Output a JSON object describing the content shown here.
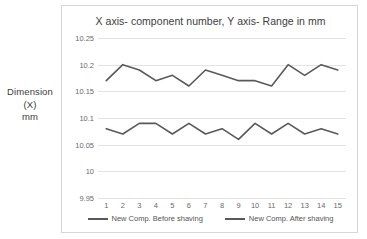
{
  "y_axis_title": "Dimension (X)\nmm",
  "y_axis_title_line1": "Dimension (X)",
  "y_axis_title_line2": "mm",
  "legend": {
    "entries": [
      {
        "label": "New Comp. Before shaving",
        "color": "#595959"
      },
      {
        "label": "New Comp. After shaving",
        "color": "#595959"
      }
    ]
  },
  "chart_data": {
    "type": "line",
    "title": "X axis- component number, Y axis- Range in mm",
    "xlabel": "",
    "ylabel": "Dimension (X) mm",
    "x": [
      1,
      2,
      3,
      4,
      5,
      6,
      7,
      8,
      9,
      10,
      11,
      12,
      13,
      14,
      15
    ],
    "categories": [
      "1",
      "2",
      "3",
      "4",
      "5",
      "6",
      "7",
      "8",
      "9",
      "10",
      "11",
      "12",
      "13",
      "14",
      "15"
    ],
    "ylim": [
      9.95,
      10.25
    ],
    "yticks": [
      9.95,
      10,
      10.05,
      10.1,
      10.15,
      10.2,
      10.25
    ],
    "ytick_labels": [
      "9.95",
      "10",
      "10.05",
      "10.1",
      "10.15",
      "10.2",
      "10.25"
    ],
    "grid": true,
    "legend_position": "bottom",
    "series": [
      {
        "name": "New Comp. Before shaving",
        "color": "#595959",
        "values": [
          10.17,
          10.2,
          10.19,
          10.17,
          10.18,
          10.16,
          10.19,
          10.18,
          10.17,
          10.17,
          10.16,
          10.2,
          10.18,
          10.2,
          10.19
        ]
      },
      {
        "name": "New Comp. After shaving",
        "color": "#595959",
        "values": [
          10.08,
          10.07,
          10.09,
          10.09,
          10.07,
          10.09,
          10.07,
          10.08,
          10.06,
          10.09,
          10.07,
          10.09,
          10.07,
          10.08,
          10.07
        ]
      }
    ]
  }
}
